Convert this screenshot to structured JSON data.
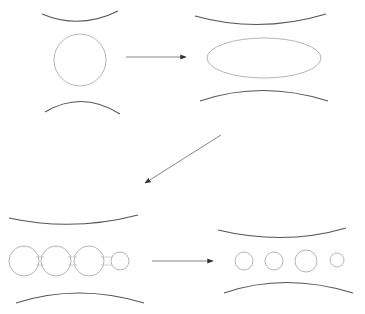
{
  "diagram": {
    "title": "",
    "colors": {
      "background": "#ffffff",
      "wall": "#555555",
      "drop_outline": "#b5b5b5",
      "arrow": "#777777",
      "arrowhead": "#333333"
    },
    "panels": [
      {
        "id": "stage-1",
        "label": "",
        "shape": "circle",
        "drop": {
          "cx": 80,
          "cy": 60,
          "r": 26
        },
        "wall_top": "M42 14 Q80 30 118 11",
        "wall_bottom": "M45 112 Q82 90 120 114"
      },
      {
        "id": "stage-2",
        "label": "",
        "shape": "ellipse",
        "drop": {
          "cx": 264,
          "cy": 58,
          "rx": 57,
          "ry": 20
        },
        "wall_top": "M195 16 Q260 34 326 14",
        "wall_bottom": "M200 101 Q262 80 328 101"
      },
      {
        "id": "stage-3",
        "label": "",
        "shape": "beaded-thread",
        "beads": [
          {
            "cx": 24,
            "cy": 261,
            "r": 15
          },
          {
            "cx": 56,
            "cy": 261,
            "r": 15
          },
          {
            "cx": 89,
            "cy": 261,
            "r": 15
          },
          {
            "cx": 120,
            "cy": 261,
            "r": 9
          }
        ],
        "wall_top": "M9 218 Q73 232 138 215",
        "wall_bottom": "M16 303 Q78 283 144 303"
      },
      {
        "id": "stage-4",
        "label": "",
        "shape": "separate-droplets",
        "droplets": [
          {
            "cx": 244,
            "cy": 261,
            "r": 9
          },
          {
            "cx": 274,
            "cy": 261,
            "r": 9
          },
          {
            "cx": 306,
            "cy": 261,
            "r": 11
          },
          {
            "cx": 337,
            "cy": 260,
            "r": 7
          }
        ],
        "wall_top": "M218 230 Q285 246 346 228",
        "wall_bottom": "M224 293 Q285 272 353 293"
      }
    ],
    "arrows": [
      {
        "id": "arrow-1-to-2",
        "from": [
          126,
          57
        ],
        "to": [
          186,
          57
        ]
      },
      {
        "id": "arrow-2-to-3",
        "from": [
          221,
          135
        ],
        "to": [
          145,
          183
        ]
      },
      {
        "id": "arrow-3-to-4",
        "from": [
          152,
          261
        ],
        "to": [
          213,
          261
        ]
      }
    ],
    "text_labels": []
  }
}
